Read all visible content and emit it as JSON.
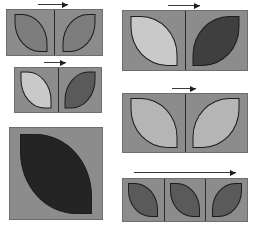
{
  "figure": {
    "kind": "abstract-shape-grid",
    "background_color": "#ffffff",
    "panel_fill": "#8c8c8c",
    "panel_border_color": "#6e6e6e",
    "cell_divider_color": "#2b2b2b",
    "shape_outline_color": "#1c1c1c",
    "shape_name": "lens-leaf",
    "tones": {
      "very_light": "#c9c9c9",
      "light": "#b5b5b5",
      "medium": "#7d7d7d",
      "medium_dark": "#5a5a5a",
      "dark": "#3f3f3f",
      "near_black": "#242424"
    },
    "arrow": {
      "name": "right-arrow",
      "direction": "right",
      "color": "#3a3a3a"
    }
  },
  "panels": [
    {
      "id": "panel-top-left",
      "x": 6,
      "y": 9,
      "width": 97,
      "height": 47,
      "cells": 2,
      "arrow": {
        "present": true,
        "x": 38,
        "y": 1,
        "width": 30
      },
      "shapes": [
        {
          "tone": "#7d7d7d",
          "orient": "ne",
          "w": 33,
          "h": 38
        },
        {
          "tone": "#7d7d7d",
          "orient": "nw",
          "w": 33,
          "h": 38
        }
      ]
    },
    {
      "id": "panel-mid-left",
      "x": 14,
      "y": 67,
      "width": 88,
      "height": 46,
      "cells": 2,
      "arrow": {
        "present": true,
        "x": 44,
        "y": 59,
        "width": 22
      },
      "shapes": [
        {
          "tone": "#c9c9c9",
          "orient": "ne",
          "w": 31,
          "h": 37
        },
        {
          "tone": "#5a5a5a",
          "orient": "nw",
          "w": 31,
          "h": 37
        }
      ]
    },
    {
      "id": "panel-bottom-left",
      "x": 9,
      "y": 127,
      "width": 94,
      "height": 93,
      "cells": 1,
      "arrow": {
        "present": false,
        "x": 0,
        "y": 0,
        "width": 0
      },
      "shapes": [
        {
          "tone": "#242424",
          "orient": "ne",
          "w": 72,
          "h": 80
        }
      ]
    },
    {
      "id": "panel-top-right",
      "x": 122,
      "y": 10,
      "width": 126,
      "height": 61,
      "cells": 2,
      "arrow": {
        "present": true,
        "x": 168,
        "y": 2,
        "width": 32
      },
      "shapes": [
        {
          "tone": "#c9c9c9",
          "orient": "ne",
          "w": 47,
          "h": 50
        },
        {
          "tone": "#3f3f3f",
          "orient": "nw",
          "w": 47,
          "h": 50
        }
      ]
    },
    {
      "id": "panel-mid-right",
      "x": 122,
      "y": 93,
      "width": 126,
      "height": 60,
      "cells": 2,
      "arrow": {
        "present": true,
        "x": 172,
        "y": 85,
        "width": 24
      },
      "shapes": [
        {
          "tone": "#b5b5b5",
          "orient": "ne",
          "w": 47,
          "h": 50
        },
        {
          "tone": "#b5b5b5",
          "orient": "nw",
          "w": 47,
          "h": 50
        }
      ]
    },
    {
      "id": "panel-bottom-right",
      "x": 122,
      "y": 178,
      "width": 126,
      "height": 44,
      "cells": 3,
      "arrow": {
        "present": true,
        "x": 134,
        "y": 169,
        "width": 102
      },
      "shapes": [
        {
          "tone": "#5a5a5a",
          "orient": "ne",
          "w": 30,
          "h": 34
        },
        {
          "tone": "#5a5a5a",
          "orient": "ne",
          "w": 30,
          "h": 34
        },
        {
          "tone": "#5a5a5a",
          "orient": "nw",
          "w": 30,
          "h": 34
        }
      ]
    }
  ]
}
